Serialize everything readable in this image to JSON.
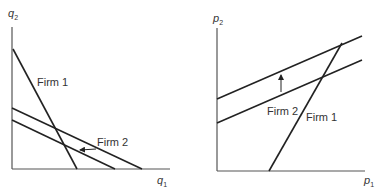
{
  "left_panel": {
    "y_axis_label": "q",
    "y_axis_sub": "2",
    "x_axis_label": "q",
    "x_axis_sub": "1",
    "firm1_label": "Firm 1",
    "firm2_label": "Firm 2"
  },
  "right_panel": {
    "y_axis_label": "p",
    "y_axis_sub": "2",
    "x_axis_label": "p",
    "x_axis_sub": "1",
    "firm1_label": "Firm 1",
    "firm2_label": "Firm 2"
  },
  "colors": {
    "line": "#222222",
    "axis": "#555555",
    "text": "#333333"
  }
}
